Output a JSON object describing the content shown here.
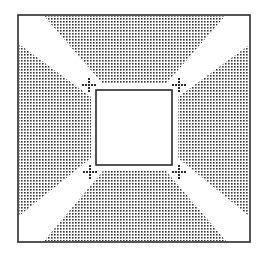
{
  "figure": {
    "colors": {
      "background": "#ffffff",
      "stroke": "#2a2a2a",
      "dots": "#3a3a3a"
    },
    "outer_square": {
      "x1": 18,
      "y1": 15,
      "x2": 250,
      "y2": 242
    },
    "inner_square": {
      "x1": 96,
      "y1": 90,
      "x2": 172,
      "y2": 165
    },
    "shaded_regions": [
      {
        "name": "top",
        "points": "44,16 225,16 166,84 103,84"
      },
      {
        "name": "left",
        "points": "19,44 91,97 91,158 19,216"
      },
      {
        "name": "right",
        "points": "249,45 249,216 178,158 178,97"
      },
      {
        "name": "bottom",
        "points": "44,241 103,171 166,171 226,241"
      }
    ],
    "markers": [
      {
        "name": "top-left",
        "cx": 89,
        "cy": 85
      },
      {
        "name": "top-right",
        "cx": 179,
        "cy": 85
      },
      {
        "name": "bottom-left",
        "cx": 90,
        "cy": 172
      },
      {
        "name": "bottom-right",
        "cx": 179,
        "cy": 172
      }
    ]
  }
}
